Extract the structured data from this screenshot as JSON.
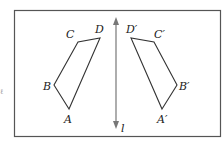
{
  "diagram": {
    "type": "reflection",
    "line_label": "l",
    "original": {
      "labels": {
        "A": "A",
        "B": "B",
        "C": "C",
        "D": "D"
      }
    },
    "image": {
      "labels": {
        "A": "A′",
        "B": "B′",
        "C": "C′",
        "D": "D′"
      }
    },
    "stray_mark": "ℓ",
    "colors": {
      "frame": "#555555",
      "shape": "#333333",
      "axis": "#777777"
    }
  }
}
